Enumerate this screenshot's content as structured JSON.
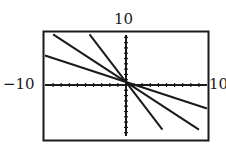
{
  "labels": {
    "ymax": "10",
    "xmin": "−10",
    "xmax": "10"
  },
  "colors": {
    "ink": "#1a1a1a",
    "background": "#ffffff"
  },
  "chart_data": {
    "type": "line",
    "title": "",
    "xlabel": "",
    "ylabel": "",
    "xlim": [
      -10,
      10
    ],
    "ylim": [
      -10,
      10
    ],
    "grid": false,
    "axis_ticks": "every 1 unit on both axes",
    "tick_labels": {
      "x_min": "-10",
      "x_max": "10",
      "y_max": "10"
    },
    "series": [
      {
        "name": "line 1 (shallow)",
        "slope": -0.5,
        "intercept": 0,
        "x": [
          -10,
          10
        ],
        "y": [
          5,
          -5
        ]
      },
      {
        "name": "line 2",
        "slope": -1,
        "intercept": 0,
        "x": [
          -9,
          9
        ],
        "y": [
          9,
          -9
        ]
      },
      {
        "name": "line 3 (steep)",
        "slope": -2,
        "intercept": 0,
        "x": [
          -4.5,
          4.5
        ],
        "y": [
          9,
          -9
        ]
      }
    ],
    "legend": null
  }
}
